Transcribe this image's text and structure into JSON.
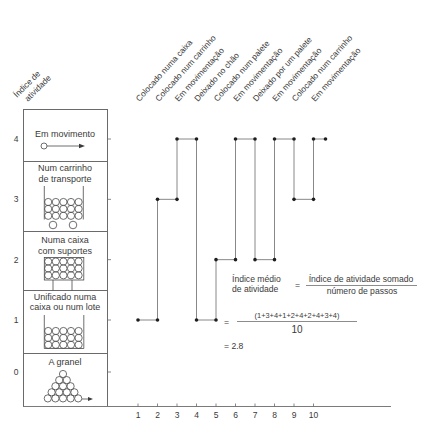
{
  "y_axis": {
    "title_lines": [
      "Índice de",
      "atividade"
    ],
    "levels": [
      {
        "value": 4,
        "label": "4",
        "label_lines": [
          "Em movimento"
        ],
        "icon": "moving-arrow-icon"
      },
      {
        "value": 3,
        "label": "3",
        "label_lines": [
          "Num carrinho",
          "de transporte"
        ],
        "icon": "cart-icon"
      },
      {
        "value": 2,
        "label": "2",
        "label_lines": [
          "Numa caixa",
          "com suportes"
        ],
        "icon": "box-with-supports-icon"
      },
      {
        "value": 1,
        "label": "1",
        "label_lines": [
          "Unificado numa",
          "caixa ou num lote"
        ],
        "icon": "unit-load-box-icon"
      },
      {
        "value": 0,
        "label": "0",
        "label_lines": [
          "A granel"
        ],
        "icon": "bulk-pile-icon"
      }
    ]
  },
  "formula": {
    "lhs_lines": [
      "Índice médio",
      "de atividade"
    ],
    "equals": "=",
    "numerator": "Índice de atividade somado",
    "denominator": "número de passos",
    "expansion_equals": "=",
    "expansion_numerator": "(1+3+4+1+2+4+2+4+3+4)",
    "expansion_denominator": "10",
    "result": "= 2.8"
  },
  "colors": {
    "line": "#7a7a7a",
    "marker": "#1e1e1e",
    "text": "#3a3a3a"
  },
  "chart_data": {
    "type": "line",
    "subtype": "step",
    "title": "",
    "xlabel": "",
    "ylabel": "Índice de atividade",
    "x": [
      "1",
      "2",
      "3",
      "4",
      "5",
      "6",
      "7",
      "8",
      "9",
      "10"
    ],
    "values": [
      1,
      3,
      4,
      1,
      2,
      4,
      2,
      4,
      3,
      4
    ],
    "step_labels": [
      "Colocado numa caixa",
      "Colocado num carrinho",
      "Em movimentação",
      "Deixado no chão",
      "Colocado num palete",
      "Em movimentação",
      "Deixado por um palete",
      "Em movimentação",
      "Colocado num carrinho",
      "Em movimentação"
    ],
    "yticks": [
      0,
      1,
      2,
      3,
      4
    ],
    "ylim": [
      0,
      4
    ],
    "xlim": [
      1,
      10
    ],
    "grid": false,
    "legend": null,
    "mean_activity_index": 2.8
  }
}
